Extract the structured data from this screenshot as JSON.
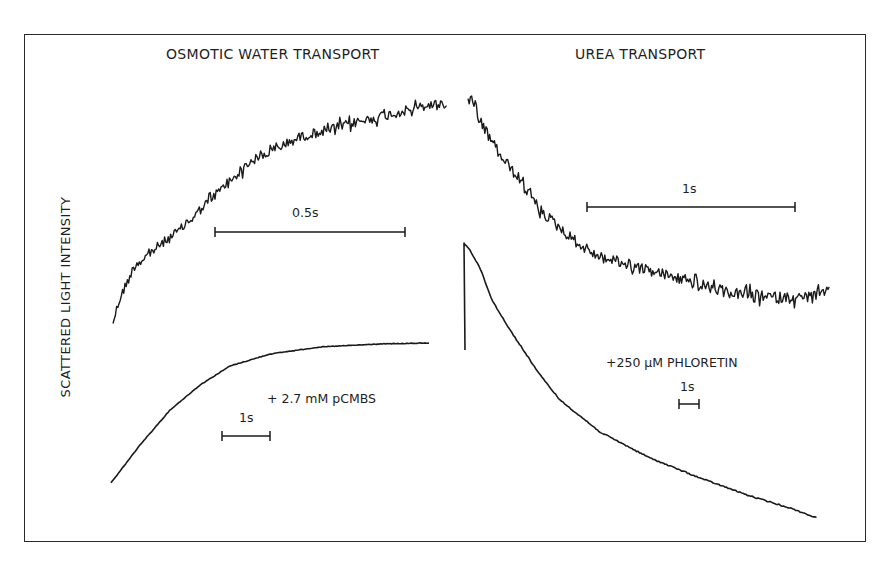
{
  "chart_data": {
    "type": "line",
    "title": "",
    "ylabel": "SCATTERED LIGHT INTENSITY",
    "xlabel": "",
    "grid": false,
    "legend": null,
    "panels": [
      {
        "title": "OSMOTIC WATER TRANSPORT",
        "series": [
          {
            "name": "control (noisy)",
            "noisy": true,
            "noise_amp": 6,
            "points_px": [
              [
                113,
                322
              ],
              [
                120,
                298
              ],
              [
                135,
                265
              ],
              [
                160,
                245
              ],
              [
                180,
                230
              ],
              [
                200,
                210
              ],
              [
                215,
                195
              ],
              [
                250,
                162
              ],
              [
                300,
                137
              ],
              [
                350,
                124
              ],
              [
                400,
                112
              ],
              [
                430,
                105
              ],
              [
                447,
                103
              ]
            ],
            "scale_bar": {
              "label": "0.5s",
              "x1": 215,
              "x2": 405,
              "y": 232
            }
          },
          {
            "name": "+ 2.7 mM pCMBS",
            "noisy": false,
            "noise_amp": 0.6,
            "points_px": [
              [
                111,
                483
              ],
              [
                140,
                445
              ],
              [
                170,
                410
              ],
              [
                200,
                385
              ],
              [
                230,
                366
              ],
              [
                270,
                354
              ],
              [
                320,
                347
              ],
              [
                380,
                344
              ],
              [
                430,
                343
              ]
            ],
            "scale_bar": {
              "label": "1s",
              "x1": 222,
              "x2": 270,
              "y": 436
            }
          }
        ]
      },
      {
        "title": "UREA TRANSPORT",
        "series": [
          {
            "name": "control (noisy)",
            "noisy": true,
            "noise_amp": 7,
            "points_px": [
              [
                468,
                97
              ],
              [
                480,
                122
              ],
              [
                500,
                155
              ],
              [
                520,
                180
              ],
              [
                540,
                210
              ],
              [
                560,
                228
              ],
              [
                580,
                245
              ],
              [
                600,
                257
              ],
              [
                640,
                268
              ],
              [
                670,
                276
              ],
              [
                700,
                285
              ],
              [
                730,
                293
              ],
              [
                770,
                297
              ],
              [
                800,
                298
              ],
              [
                830,
                292
              ]
            ],
            "scale_bar": {
              "label": "1s",
              "x1": 587,
              "x2": 795,
              "y": 207
            }
          },
          {
            "name": "+250 μM PHLORETIN",
            "noisy": false,
            "noise_amp": 1.2,
            "points_px": [
              [
                465,
                350
              ],
              [
                464,
                243
              ],
              [
                470,
                250
              ],
              [
                480,
                268
              ],
              [
                492,
                300
              ],
              [
                510,
                330
              ],
              [
                520,
                345
              ],
              [
                540,
                375
              ],
              [
                560,
                400
              ],
              [
                600,
                432
              ],
              [
                650,
                458
              ],
              [
                700,
                478
              ],
              [
                750,
                496
              ],
              [
                790,
                508
              ],
              [
                817,
                518
              ]
            ],
            "scale_bar": {
              "label": "1s",
              "x1": 679,
              "x2": 699,
              "y": 404
            }
          }
        ]
      }
    ],
    "annotations": [
      "0.5s",
      "1s",
      "+ 2.7 mM pCMBS",
      "1s",
      "+250 μM PHLORETIN",
      "1s"
    ]
  },
  "labels": {
    "panel_left_title": "OSMOTIC WATER TRANSPORT",
    "panel_right_title": "UREA TRANSPORT",
    "y_axis": "SCATTERED LIGHT INTENSITY",
    "left_upper_scale": "0.5s",
    "left_lower_scale": "1s",
    "left_lower_treatment": "+ 2.7 mM pCMBS",
    "right_upper_scale": "1s",
    "right_lower_scale": "1s",
    "right_lower_treatment": "+250 μM PHLORETIN"
  },
  "colors": {
    "ink": "#1a1a1a",
    "frame": "#2a2a2a",
    "background": "#ffffff"
  }
}
